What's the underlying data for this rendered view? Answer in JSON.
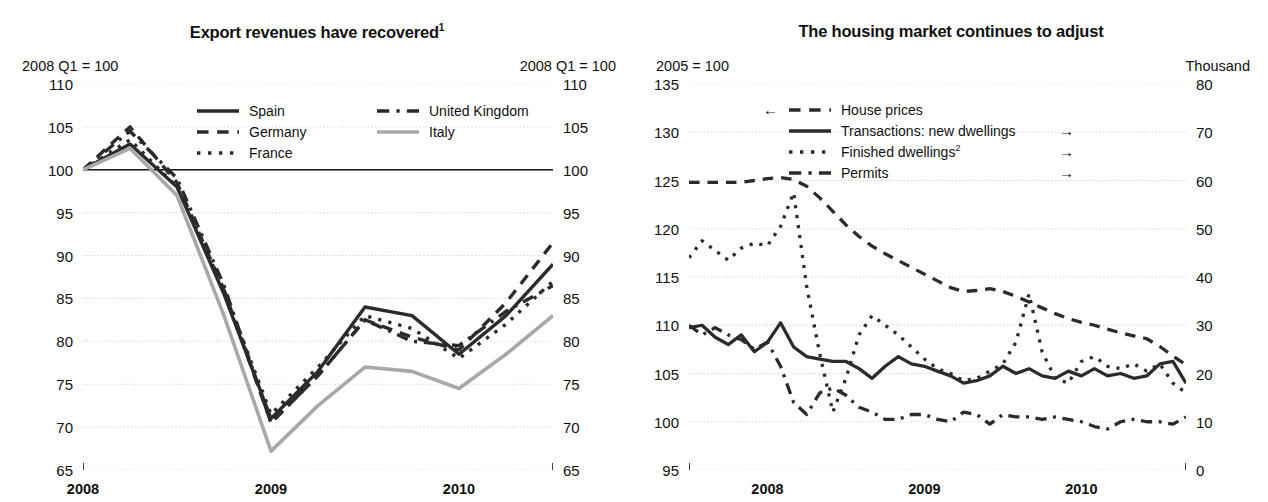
{
  "chart_data": [
    {
      "id": "left",
      "type": "line",
      "title": "Export revenues have recovered",
      "title_footnote": "1",
      "unit_left": "2008 Q1 = 100",
      "unit_right": "2008 Q1 = 100",
      "xlabel": "",
      "ylabel": "",
      "ylim": [
        65,
        110
      ],
      "yticks": [
        65,
        70,
        75,
        80,
        85,
        90,
        95,
        100,
        105,
        110
      ],
      "yticks_right": [
        65,
        70,
        75,
        80,
        85,
        90,
        95,
        100,
        105,
        110
      ],
      "grid": true,
      "reference_line": 100,
      "legend_position": "upper-center",
      "x": [
        "2008Q1",
        "2008Q2",
        "2008Q3",
        "2008Q4",
        "2009Q1",
        "2009Q2",
        "2009Q3",
        "2009Q4",
        "2010Q1",
        "2010Q2",
        "2010Q3"
      ],
      "xtick_labels": [
        "2008",
        "2009",
        "2010"
      ],
      "series": [
        {
          "name": "Spain",
          "style": "solid",
          "color": "#2b2b2b",
          "values": [
            100.0,
            103.0,
            98.0,
            85.5,
            71.0,
            76.5,
            84.0,
            83.0,
            78.5,
            83.0,
            89.0
          ]
        },
        {
          "name": "Germany",
          "style": "dashed",
          "color": "#2b2b2b",
          "values": [
            100.0,
            105.0,
            98.5,
            86.0,
            70.5,
            76.0,
            82.5,
            80.5,
            79.0,
            84.5,
            91.5
          ]
        },
        {
          "name": "France",
          "style": "dotted",
          "color": "#2b2b2b",
          "values": [
            100.0,
            103.5,
            98.0,
            86.0,
            71.5,
            77.0,
            83.0,
            81.5,
            78.0,
            82.0,
            87.0
          ]
        },
        {
          "name": "United Kingdom",
          "style": "dashdot",
          "color": "#2b2b2b",
          "values": [
            100.0,
            104.5,
            99.0,
            86.5,
            70.5,
            76.0,
            82.5,
            80.0,
            79.5,
            83.5,
            86.5
          ]
        },
        {
          "name": "Italy",
          "style": "solid",
          "color": "#a8a8a8",
          "values": [
            100.0,
            102.5,
            97.0,
            83.0,
            67.2,
            72.5,
            77.0,
            76.5,
            74.5,
            78.5,
            83.0
          ]
        }
      ]
    },
    {
      "id": "right",
      "type": "line",
      "title": "The housing market continues to adjust",
      "unit_left": "2005 = 100",
      "unit_right": "Thousand",
      "ylim": [
        95,
        135
      ],
      "yticks": [
        95,
        100,
        105,
        110,
        115,
        120,
        125,
        130,
        135
      ],
      "ylim_right": [
        0,
        80
      ],
      "yticks_right": [
        0,
        10,
        20,
        30,
        40,
        50,
        60,
        70,
        80
      ],
      "grid": true,
      "legend_position": "upper-center",
      "xtick_labels": [
        "2008",
        "2009",
        "2010"
      ],
      "x_start": "2007-07",
      "x_end": "2010-10",
      "series": [
        {
          "name": "House prices",
          "style": "dashed",
          "axis": "left",
          "arrow": "left",
          "color": "#2b2b2b",
          "values": [
            124.8,
            124.8,
            124.8,
            124.8,
            124.8,
            125.0,
            125.2,
            125.3,
            125.1,
            124.4,
            123.2,
            121.8,
            120.4,
            119.2,
            118.2,
            117.4,
            116.7,
            116.0,
            115.3,
            114.6,
            113.9,
            113.5,
            113.6,
            113.8,
            113.5,
            113.0,
            112.4,
            111.8,
            111.2,
            110.7,
            110.3,
            110.0,
            109.6,
            109.2,
            108.9,
            108.6,
            107.8,
            106.8,
            105.9
          ]
        },
        {
          "name": "Transactions: new dwellings",
          "style": "solid",
          "axis": "right",
          "arrow": "right",
          "color": "#2b2b2b",
          "values": [
            29.5,
            30.0,
            27.5,
            26.0,
            28.0,
            24.5,
            26.5,
            30.5,
            25.5,
            23.5,
            23.0,
            22.5,
            22.5,
            21.0,
            19.0,
            21.5,
            23.5,
            22.0,
            21.5,
            20.5,
            19.5,
            18.0,
            18.5,
            19.5,
            21.5,
            20.0,
            21.0,
            19.5,
            19.0,
            20.5,
            19.5,
            21.0,
            19.5,
            20.0,
            19.0,
            19.5,
            22.0,
            22.5,
            18.0
          ]
        },
        {
          "name": "Finished dwellings",
          "style": "dotted",
          "footnote": "2",
          "axis": "right",
          "arrow": "right",
          "color": "#2b2b2b",
          "values": [
            44.0,
            47.5,
            45.5,
            43.5,
            46.0,
            47.0,
            46.5,
            50.5,
            57.5,
            38.0,
            24.0,
            12.0,
            19.0,
            28.0,
            32.0,
            30.0,
            28.0,
            25.5,
            23.0,
            21.0,
            20.0,
            18.5,
            19.0,
            20.5,
            22.0,
            26.5,
            36.5,
            24.5,
            19.0,
            18.0,
            22.5,
            23.5,
            21.5,
            21.0,
            22.0,
            20.5,
            22.0,
            18.0,
            16.0
          ]
        },
        {
          "name": "Permits",
          "style": "dashdot",
          "axis": "right",
          "arrow": "right",
          "color": "#2b2b2b",
          "values": [
            30.0,
            28.0,
            29.5,
            28.0,
            27.0,
            25.0,
            26.5,
            21.5,
            14.0,
            11.5,
            16.0,
            17.0,
            15.5,
            13.0,
            12.0,
            10.5,
            10.5,
            11.5,
            11.5,
            10.5,
            10.0,
            12.0,
            11.5,
            9.5,
            11.5,
            11.0,
            11.0,
            10.5,
            11.0,
            10.5,
            10.0,
            9.0,
            8.5,
            10.0,
            10.5,
            10.0,
            10.0,
            9.5,
            11.0
          ]
        }
      ]
    }
  ]
}
